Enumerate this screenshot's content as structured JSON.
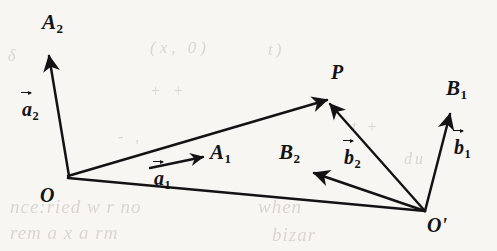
{
  "figure": {
    "type": "vector-diagram",
    "background_color": "#f7f6f3",
    "ink_color": "#131313",
    "points": [
      {
        "id": "O",
        "label": "O",
        "x": 68,
        "y": 176
      },
      {
        "id": "Op",
        "label": "O'",
        "x": 425,
        "y": 211
      },
      {
        "id": "P",
        "label": "P",
        "x": 325,
        "y": 98
      }
    ],
    "vectors": [
      {
        "id": "a2",
        "label_base": "a",
        "label_sub": "2",
        "head_label_base": "A",
        "head_label_sub": "2",
        "from": "O",
        "from_x": 68,
        "from_y": 176,
        "to_x": 48,
        "to_y": 52
      },
      {
        "id": "a1",
        "label_base": "a",
        "label_sub": "1",
        "head_label_base": "A",
        "head_label_sub": "1",
        "from": "O",
        "from_x": 149,
        "from_y": 168,
        "to_x": 206,
        "to_y": 156
      },
      {
        "id": "b1",
        "label_base": "b",
        "label_sub": "1",
        "head_label_base": "B",
        "head_label_sub": "1",
        "from": "Op",
        "from_x": 425,
        "from_y": 211,
        "to_x": 451,
        "to_y": 110
      },
      {
        "id": "b2",
        "label_base": "b",
        "label_sub": "2",
        "head_label_base": "B",
        "head_label_sub": "2",
        "from": "Op",
        "from_x": 425,
        "from_y": 211,
        "to_x": 311,
        "to_y": 172
      }
    ],
    "rays_to_P": [
      {
        "from": "O",
        "x1": 68,
        "y1": 176,
        "x2": 325,
        "y2": 98
      },
      {
        "from": "Op",
        "x1": 425,
        "y1": 211,
        "x2": 329,
        "y2": 103
      }
    ],
    "baseline": {
      "from": "O",
      "to": "Op",
      "x1": 68,
      "y1": 178,
      "x2": 425,
      "y2": 211
    },
    "labels": {
      "A2": {
        "text": "A",
        "sub": "2",
        "x": 42,
        "y": 12
      },
      "a2_vec": {
        "text": "a",
        "sub": "2",
        "x": 22,
        "y": 100
      },
      "O": {
        "text": "O",
        "sub": "",
        "x": 40,
        "y": 185
      },
      "A1": {
        "text": "A",
        "sub": "1",
        "x": 210,
        "y": 142
      },
      "a1_vec": {
        "text": "a",
        "sub": "1",
        "x": 154,
        "y": 170
      },
      "P": {
        "text": "P",
        "sub": "",
        "x": 331,
        "y": 62
      },
      "B2": {
        "text": "B",
        "sub": "2",
        "x": 279,
        "y": 142
      },
      "b2_vec": {
        "text": "b",
        "sub": "2",
        "x": 344,
        "y": 148
      },
      "B1": {
        "text": "B",
        "sub": "1",
        "x": 446,
        "y": 78
      },
      "b1_vec": {
        "text": "b",
        "sub": "1",
        "x": 454,
        "y": 138
      },
      "Op": {
        "text": "O'",
        "sub": "",
        "x": 427,
        "y": 215
      }
    }
  },
  "bleed_text": {
    "line1": "(x, 0)",
    "line2": "t)",
    "line3": "δ",
    "line4": "+ +",
    "line5": "t +",
    "line6": "- ,",
    "line7": "nce:ried w r  no",
    "line8": "rem  a  x  a  rm",
    "line9": "when",
    "line10": "bizar",
    "line11": "du"
  }
}
